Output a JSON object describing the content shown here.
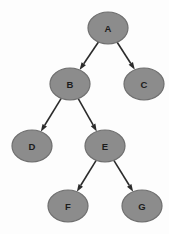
{
  "diagram": {
    "type": "directed-graph",
    "background_color": "#fdfdfd",
    "node_fill_color": "#8c8c8c",
    "node_border_color": "#6e6e6e",
    "node_label_color": "#1c1c1c",
    "edge_color": "#2b2b2b",
    "node_shape": "ellipse",
    "node_rx": 20,
    "node_ry": 16,
    "nodes": [
      {
        "id": "A",
        "label": "A",
        "cx": 108,
        "cy": 28
      },
      {
        "id": "B",
        "label": "B",
        "cx": 70,
        "cy": 84
      },
      {
        "id": "C",
        "label": "C",
        "cx": 144,
        "cy": 84
      },
      {
        "id": "D",
        "label": "D",
        "cx": 32,
        "cy": 146
      },
      {
        "id": "E",
        "label": "E",
        "cx": 105,
        "cy": 146
      },
      {
        "id": "F",
        "label": "F",
        "cx": 68,
        "cy": 206
      },
      {
        "id": "G",
        "label": "G",
        "cx": 142,
        "cy": 206
      }
    ],
    "edges": [
      {
        "from": "A",
        "to": "B",
        "directed": true
      },
      {
        "from": "A",
        "to": "C",
        "directed": true
      },
      {
        "from": "B",
        "to": "D",
        "directed": true
      },
      {
        "from": "B",
        "to": "E",
        "directed": true
      },
      {
        "from": "E",
        "to": "F",
        "directed": true
      },
      {
        "from": "E",
        "to": "G",
        "directed": true
      }
    ]
  }
}
